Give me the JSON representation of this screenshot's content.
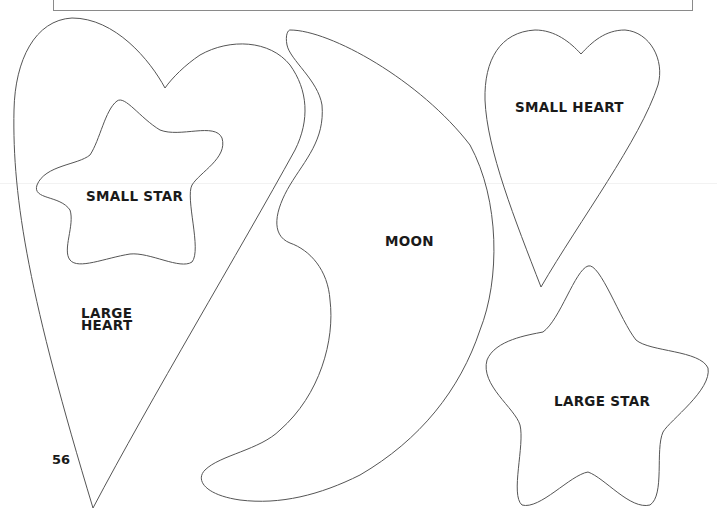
{
  "page": {
    "page_number": "56",
    "stroke_color": "#555555",
    "background": "#ffffff"
  },
  "templates": [
    {
      "id": "large-heart",
      "label": "LARGE\nHEART"
    },
    {
      "id": "small-star",
      "label": "SMALL STAR"
    },
    {
      "id": "moon",
      "label": "MOON"
    },
    {
      "id": "small-heart",
      "label": "SMALL HEART"
    },
    {
      "id": "large-star",
      "label": "LARGE STAR"
    }
  ]
}
